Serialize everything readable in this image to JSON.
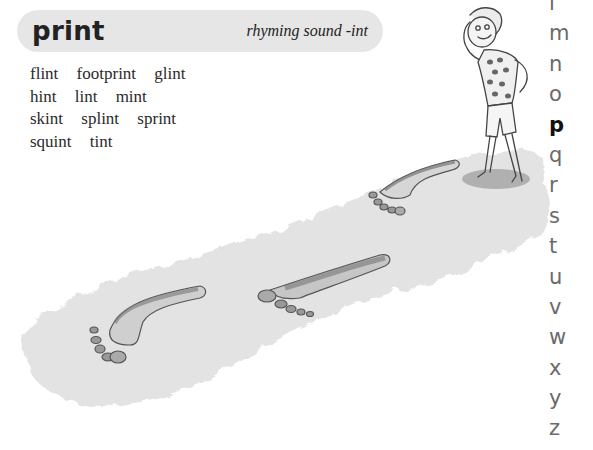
{
  "header": {
    "headword": "print",
    "subtitle": "rhyming sound -int"
  },
  "word_lines": [
    [
      "flint",
      "footprint",
      "glint"
    ],
    [
      "hint",
      "lint",
      "mint"
    ],
    [
      "skint",
      "splint",
      "sprint"
    ],
    [
      "squint",
      "tint"
    ]
  ],
  "alphabet": {
    "letters": [
      "l",
      "m",
      "n",
      "o",
      "p",
      "q",
      "r",
      "s",
      "t",
      "u",
      "v",
      "w",
      "x",
      "y",
      "z"
    ],
    "active": "p"
  },
  "illustration": {
    "description": "boy shading eyes standing on sand with trail of footprints",
    "colors": {
      "sand": "#e4e4e4",
      "ink": "#555555",
      "shadow": "#9a9a9a"
    }
  }
}
